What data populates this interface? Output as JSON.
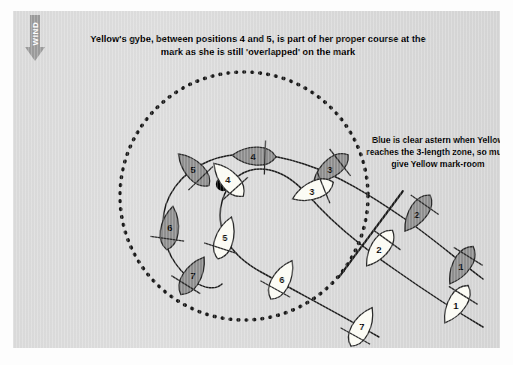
{
  "page": {
    "background_color": "#ffffff",
    "panel_color": "#d9d9d9"
  },
  "wind": {
    "label": "WIND",
    "icon": "down-arrow-icon",
    "color": "#9a9a9a"
  },
  "title": "Yellow's gybe, between positions 4 and 5, is part of her proper course at the mark as she is still 'overlapped' on the mark",
  "annotation": "Blue is clear astern when Yellow reaches the 3-length zone, so must give Yellow mark-room",
  "mark": {
    "name": "racing-mark",
    "color": "#000000",
    "cx": 210,
    "cy": 173,
    "r": 7
  },
  "zone": {
    "name": "three-length-zone",
    "style": "dotted",
    "cx": 231,
    "cy": 185,
    "r": 124,
    "dot_color": "#1a1a1a"
  },
  "boats": {
    "blue": {
      "name": "Blue",
      "fill": "#8e8e8e",
      "stroke": "#2a2a2a",
      "positions": [
        {
          "label": "1",
          "x": 448,
          "y": 255,
          "rot": 212
        },
        {
          "label": "2",
          "x": 404,
          "y": 203,
          "rot": 215
        },
        {
          "label": "3",
          "x": 317,
          "y": 158,
          "rot": 232
        },
        {
          "label": "4",
          "x": 240,
          "y": 145,
          "rot": 272
        },
        {
          "label": "5",
          "x": 180,
          "y": 158,
          "rot": 316
        },
        {
          "label": "6",
          "x": 157,
          "y": 216,
          "rot": 8
        },
        {
          "label": "7",
          "x": 180,
          "y": 264,
          "rot": 32
        }
      ]
    },
    "yellow": {
      "name": "Yellow",
      "fill": "#fbfbf4",
      "stroke": "#2a2a2a",
      "positions": [
        {
          "label": "1",
          "x": 443,
          "y": 294,
          "rot": 212
        },
        {
          "label": "2",
          "x": 366,
          "y": 238,
          "rot": 216
        },
        {
          "label": "3",
          "x": 299,
          "y": 180,
          "rot": 248
        },
        {
          "label": "4",
          "x": 215,
          "y": 168,
          "rot": 318
        },
        {
          "label": "5",
          "x": 212,
          "y": 226,
          "rot": 18
        },
        {
          "label": "6",
          "x": 269,
          "y": 268,
          "rot": 29
        },
        {
          "label": "7",
          "x": 349,
          "y": 315,
          "rot": 29
        }
      ]
    }
  },
  "leader_line": {
    "name": "annotation-leader-line",
    "x1": 390,
    "y1": 180,
    "x2": 326,
    "y2": 266
  }
}
